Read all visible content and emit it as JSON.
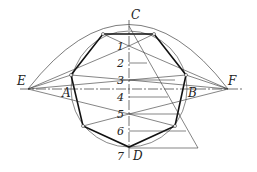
{
  "diagram": {
    "points": {
      "C": "C",
      "D": "D",
      "E": "E",
      "F": "F",
      "A": "A",
      "B": "B"
    },
    "divisions": [
      "1",
      "2",
      "3",
      "4",
      "5",
      "6",
      "7"
    ],
    "colors": {
      "line": "#222222",
      "background": "#ffffff"
    }
  }
}
